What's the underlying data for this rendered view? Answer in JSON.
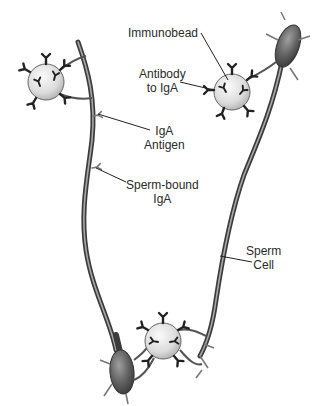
{
  "diagram": {
    "title_fragment": "",
    "labels": {
      "immunobead": "Immunobead",
      "antibody_to_iga": [
        "Antibody",
        "to IgA"
      ],
      "iga_antigen": [
        "IgA",
        "Antigen"
      ],
      "sperm_bound_iga": [
        "Sperm-bound",
        "IgA"
      ],
      "sperm_cell": [
        "Sperm",
        "Cell"
      ]
    },
    "colors": {
      "bead_fill": "#e6e6e6",
      "bead_stroke": "#555555",
      "antibody": "#222222",
      "sperm_body": "#6a6a6a",
      "tail": "#5a5a5a",
      "leader": "#222222",
      "text": "#2a2a2a"
    },
    "components": [
      {
        "name": "immunobead-left",
        "cx": 46,
        "cy": 82,
        "r": 18
      },
      {
        "name": "immunobead-right",
        "cx": 232,
        "cy": 92,
        "r": 18
      },
      {
        "name": "immunobead-bottom",
        "cx": 163,
        "cy": 341,
        "r": 18
      },
      {
        "name": "sperm-cell-left",
        "head_at": [
          118,
          370
        ]
      },
      {
        "name": "sperm-cell-right",
        "head_at": [
          290,
          35
        ]
      }
    ]
  }
}
